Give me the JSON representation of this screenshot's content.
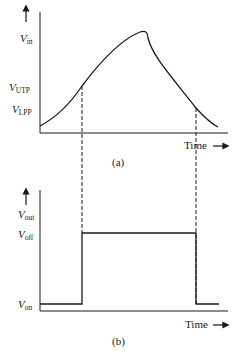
{
  "panel_a": {
    "caption": "(a)",
    "y_label": {
      "main": "V",
      "sub": "in"
    },
    "levels": [
      {
        "main": "V",
        "sub": "UTP"
      },
      {
        "main": "V",
        "sub": "LPP"
      }
    ],
    "x_label": "Time",
    "arrow": "→"
  },
  "panel_b": {
    "caption": "(b)",
    "y_label": {
      "main": "V",
      "sub": "out"
    },
    "levels": [
      {
        "main": "V",
        "sub": "off"
      },
      {
        "main": "V",
        "sub": "on"
      }
    ],
    "x_label": "Time",
    "arrow": "→"
  },
  "colors": {
    "line": "#1a1a1a",
    "background": "#ffffff"
  }
}
